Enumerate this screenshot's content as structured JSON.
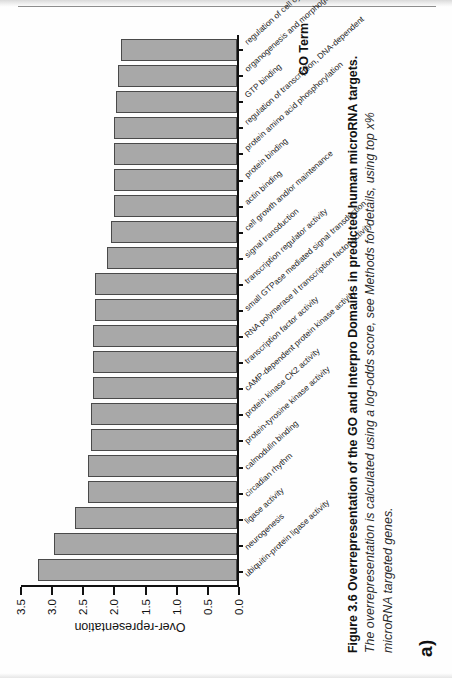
{
  "panel": {
    "letter": "a)"
  },
  "caption": {
    "figure_label": "Figure 3.6",
    "bold_text": "Overrepresentation of the GO and Interpro Domains in predicted human microRNA targets.",
    "italic_text": "The overrepresentation is calculated using a log-odds score, see Methods for details, using top x% microRNA targeted genes."
  },
  "chart_data": {
    "type": "bar",
    "orientation": "vertical",
    "title": "",
    "xlabel": "GO Term",
    "ylabel": "Over-representation",
    "ylim": [
      0.0,
      3.5
    ],
    "yticks": [
      "0.0",
      "0.5",
      "1.0",
      "1.5",
      "2.0",
      "2.5",
      "3.0",
      "3.5"
    ],
    "grid": false,
    "legend": "none",
    "bar_color": "#a8a8a8",
    "bar_edge_color": "#4a4a4a",
    "categories": [
      "ubiquitin-protein ligase activity",
      "neurogenesis",
      "ligase activity",
      "circadian rhythm",
      "calmodulin binding",
      "protein-tyrosine kinase activity",
      "protein kinase CK2 activity",
      "cAMP-dependent protein kinase activity",
      "transcription factor activity",
      "RNA polymerase II transcription factor activity",
      "small GTPase mediated signal transduction",
      "transcription regulator activity",
      "signal transduction",
      "cell growth and/or maintenance",
      "actin binding",
      "protein binding",
      "protein amino acid phosphorylation",
      "regulation of transcription, DNA-dependent",
      "GTP binding",
      "organogenesis and morphogenesis",
      "regulation of cell cycle"
    ],
    "values": [
      3.22,
      2.96,
      2.62,
      2.42,
      2.42,
      2.36,
      2.36,
      2.33,
      2.33,
      2.33,
      2.3,
      2.3,
      2.1,
      2.05,
      2.0,
      2.0,
      2.0,
      2.0,
      1.96,
      1.93,
      1.88
    ]
  }
}
